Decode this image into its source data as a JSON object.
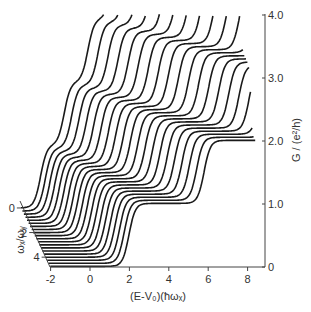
{
  "chart_data": {
    "type": "line",
    "title": "",
    "xlabel": "(E-V₀)(ħωₓ)",
    "ylabel": "G / (e²/h)",
    "depth_label": "ωₓ/ωᵧ",
    "xlim": [
      -2,
      8.5
    ],
    "ylim": [
      0,
      4
    ],
    "depth_lim": [
      0,
      4.8
    ],
    "x_ticks": [
      -2,
      0,
      2,
      4,
      6,
      8
    ],
    "x_tick_labels": [
      "-2",
      "0",
      "2",
      "4",
      "6",
      "8"
    ],
    "y_ticks": [
      0,
      1,
      2,
      3,
      4
    ],
    "y_tick_labels": [
      "0",
      "1.0",
      "2.0",
      "3.0",
      "4.0"
    ],
    "depth_ticks": [
      0,
      2,
      4
    ],
    "depth_tick_labels": [
      "0",
      "2",
      "4"
    ],
    "grid": false,
    "legend": null,
    "series_count": 20,
    "series": [
      {
        "name": "ωx/ωy = 0.00",
        "ratio": 0.0
      },
      {
        "name": "ωx/ωy = 0.25",
        "ratio": 0.25
      },
      {
        "name": "ωx/ωy = 0.50",
        "ratio": 0.5
      },
      {
        "name": "ωx/ωy = 0.75",
        "ratio": 0.75
      },
      {
        "name": "ωx/ωy = 1.00",
        "ratio": 1.0
      },
      {
        "name": "ωx/ωy = 1.25",
        "ratio": 1.25
      },
      {
        "name": "ωx/ωy = 1.50",
        "ratio": 1.5
      },
      {
        "name": "ωx/ωy = 1.75",
        "ratio": 1.75
      },
      {
        "name": "ωx/ωy = 2.00",
        "ratio": 2.0
      },
      {
        "name": "ωx/ωy = 2.25",
        "ratio": 2.25
      },
      {
        "name": "ωx/ωy = 2.50",
        "ratio": 2.5
      },
      {
        "name": "ωx/ωy = 2.75",
        "ratio": 2.75
      },
      {
        "name": "ωx/ωy = 3.00",
        "ratio": 3.0
      },
      {
        "name": "ωx/ωy = 3.25",
        "ratio": 3.25
      },
      {
        "name": "ωx/ωy = 3.50",
        "ratio": 3.5
      },
      {
        "name": "ωx/ωy = 3.75",
        "ratio": 3.75
      },
      {
        "name": "ωx/ωy = 4.00",
        "ratio": 4.0
      },
      {
        "name": "ωx/ωy = 4.25",
        "ratio": 4.25
      },
      {
        "name": "ωx/ωy = 4.50",
        "ratio": 4.5
      },
      {
        "name": "ωx/ωy = 4.75",
        "ratio": 4.75
      }
    ],
    "model_note": "Each curve shows steps of G in units of e²/h; step positions at E = ħωy(n+1/2) - ħωx/2 in units of ħωx; front curve first step near E≈2, back curve steps near E≈-1.",
    "colors": {
      "line": "#1a1a1a",
      "axis": "#444444",
      "background": "#ffffff"
    }
  },
  "labels": {
    "x_axis_title": "(E-V₀)(ħωₓ)",
    "y_axis_title": "G / (e²/h)",
    "depth_axis_title": "ωₓ/ωᵧ"
  }
}
